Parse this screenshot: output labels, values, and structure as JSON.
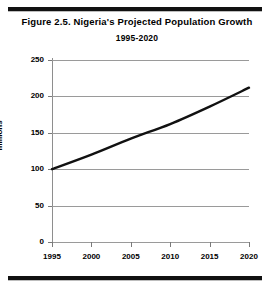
{
  "figure": {
    "title": "Figure 2.5.  Nigeria's Projected Population Growth",
    "subtitle": "1995-2020"
  },
  "chart_data": {
    "type": "line",
    "title": "Figure 2.5.  Nigeria's Projected Population Growth",
    "subtitle": "1995-2020",
    "xlabel": "",
    "ylabel": "millions",
    "x": [
      1995,
      2000,
      2005,
      2010,
      2015,
      2020
    ],
    "values": [
      100,
      120,
      142,
      162,
      186,
      212
    ],
    "series": [
      {
        "name": "Projected population",
        "values": [
          100,
          120,
          142,
          162,
          186,
          212
        ]
      }
    ],
    "xlim": [
      1995,
      2020
    ],
    "ylim": [
      0,
      250
    ],
    "ytick_labels": [
      "0",
      "50",
      "100",
      "150",
      "200",
      "250"
    ],
    "yticks": [
      0,
      50,
      100,
      150,
      200,
      250
    ],
    "xtick_labels": [
      "1995",
      "2000",
      "2005",
      "2010",
      "2015",
      "2020"
    ],
    "xticks": [
      1995,
      2000,
      2005,
      2010,
      2015,
      2020
    ],
    "grid": "horizontal",
    "legend": "none",
    "line_color": "#111111",
    "grid_color": "#9a9a9a",
    "background": "#ffffff"
  }
}
